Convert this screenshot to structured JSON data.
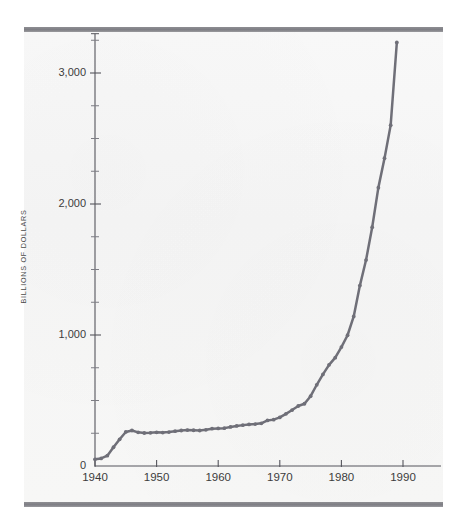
{
  "figure": {
    "background_color": "#f7f7f6",
    "rule_color": "#82828a",
    "line_color": "#6f6f78",
    "text_color": "#3c3c3c"
  },
  "chart_data": {
    "type": "line",
    "title": "",
    "subtitle": "",
    "xlabel": "",
    "ylabel": "BILLIONS OF DOLLARS",
    "xlim": [
      1940,
      1990
    ],
    "ylim": [
      0,
      3300
    ],
    "grid": false,
    "legend": null,
    "x_ticks": [
      1940,
      1950,
      1960,
      1970,
      1980,
      1990
    ],
    "x_tick_labels": [
      "1940",
      "1950",
      "1960",
      "1970",
      "1980",
      "1990"
    ],
    "y_ticks": [
      0,
      1000,
      2000,
      3000
    ],
    "y_tick_labels": [
      "0",
      "1,000",
      "2,000",
      "3,000"
    ],
    "y_minor_ticks": [
      250,
      500,
      750,
      1250,
      1500,
      1750,
      2250,
      2500,
      2750,
      3250
    ],
    "marker": "dot",
    "series": [
      {
        "name": "Gross federal debt",
        "color": "#6f6f78",
        "x": [
          1940,
          1941,
          1942,
          1943,
          1944,
          1945,
          1946,
          1947,
          1948,
          1949,
          1950,
          1951,
          1952,
          1953,
          1954,
          1955,
          1956,
          1957,
          1958,
          1959,
          1960,
          1961,
          1962,
          1963,
          1964,
          1965,
          1966,
          1967,
          1968,
          1969,
          1970,
          1971,
          1972,
          1973,
          1974,
          1975,
          1976,
          1977,
          1978,
          1979,
          1980,
          1981,
          1982,
          1983,
          1984,
          1985,
          1986,
          1987,
          1988,
          1989
        ],
        "values": [
          51,
          58,
          79,
          143,
          204,
          260,
          271,
          257,
          252,
          253,
          257,
          255,
          259,
          266,
          271,
          274,
          273,
          271,
          276,
          285,
          287,
          289,
          298,
          306,
          312,
          317,
          320,
          326,
          348,
          354,
          371,
          398,
          427,
          458,
          475,
          533,
          620,
          699,
          772,
          827,
          908,
          998,
          1142,
          1377,
          1572,
          1823,
          2125,
          2350,
          2602,
          3233
        ]
      }
    ]
  }
}
